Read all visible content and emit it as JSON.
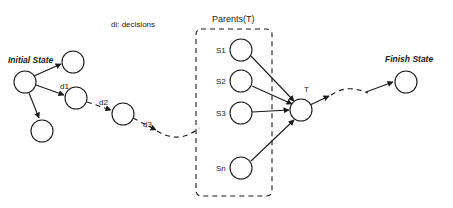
{
  "diagram": {
    "title_labels": {
      "decisions_legend": "di: decisions",
      "parents_group": "Parents(T)",
      "initial_state": "Initial State",
      "finish_state": "Finish State"
    },
    "colors": {
      "stroke": "#1a1a1a",
      "fill": "#ffffff",
      "background": "#ffffff"
    },
    "nodes": [
      {
        "id": "initial",
        "label": "",
        "cx": 25,
        "cy": 82,
        "r": 11
      },
      {
        "id": "branch-up",
        "label": "",
        "cx": 73,
        "cy": 62,
        "r": 11
      },
      {
        "id": "branch-down",
        "label": "",
        "cx": 42,
        "cy": 131,
        "r": 11
      },
      {
        "id": "d1-node",
        "label": "",
        "cx": 76,
        "cy": 98,
        "r": 11
      },
      {
        "id": "d2-node",
        "label": "",
        "cx": 123,
        "cy": 114,
        "r": 11
      },
      {
        "id": "s1",
        "label": "S1",
        "cx": 241,
        "cy": 50,
        "r": 11
      },
      {
        "id": "s2",
        "label": "S2",
        "cx": 241,
        "cy": 81,
        "r": 11
      },
      {
        "id": "s3",
        "label": "S3",
        "cx": 241,
        "cy": 113,
        "r": 11
      },
      {
        "id": "sn",
        "label": "Sn",
        "cx": 241,
        "cy": 168,
        "r": 11
      },
      {
        "id": "t",
        "label": "T",
        "cx": 301,
        "cy": 110,
        "r": 11
      },
      {
        "id": "finish",
        "label": "",
        "cx": 406,
        "cy": 82,
        "r": 11
      }
    ],
    "edge_labels": [
      {
        "id": "d1",
        "text": "d1",
        "x": 62,
        "y": 86
      },
      {
        "id": "d2",
        "text": "d2",
        "x": 101,
        "y": 102
      },
      {
        "id": "d3",
        "text": "d3",
        "x": 146,
        "y": 124
      }
    ],
    "node_labels": {
      "s1": "S1",
      "s2": "S2",
      "s3": "S3",
      "sn": "Sn",
      "t": "T"
    },
    "group": {
      "label": "Parents(T)",
      "x": 196,
      "y": 29,
      "width": 76,
      "height": 167
    },
    "edges": [
      {
        "from": "initial",
        "to": "branch-up",
        "style": "solid"
      },
      {
        "from": "initial",
        "to": "branch-down",
        "style": "solid"
      },
      {
        "from": "initial",
        "to": "d1-node",
        "style": "solid"
      },
      {
        "from": "d1-node",
        "to": "d2-node",
        "style": "dashed"
      },
      {
        "from": "d2-node",
        "to": "path-continue",
        "style": "dashed"
      },
      {
        "from": "path-continue",
        "to": "group-edge",
        "style": "dashed"
      },
      {
        "from": "s1",
        "to": "t",
        "style": "solid"
      },
      {
        "from": "s2",
        "to": "t",
        "style": "solid"
      },
      {
        "from": "s3",
        "to": "t",
        "style": "solid"
      },
      {
        "from": "sn",
        "to": "t",
        "style": "solid"
      },
      {
        "from": "t",
        "to": "finish",
        "style": "dashed"
      }
    ]
  }
}
